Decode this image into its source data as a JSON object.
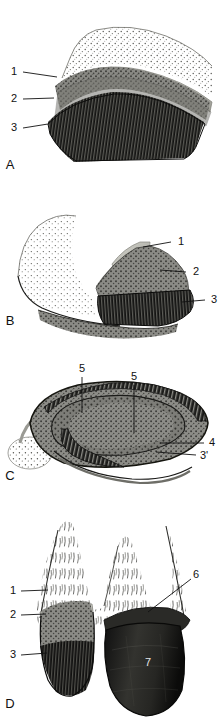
{
  "figure": {
    "type": "anatomical-illustration",
    "panel_count": 4,
    "background_color": "#ffffff",
    "ink_color": "#111111"
  },
  "palette": {
    "paper": "#ffffff",
    "ink": "#111111",
    "skin_stipple": "#ffffff",
    "band_light": "#b9b9b3",
    "band_light_edge": "#8e8e88",
    "layer_mid": "#7d7d78",
    "layer_mid_dark": "#5e5e59",
    "layer_dark": "#2a2a28",
    "layer_darkest": "#141413",
    "horn_black": "#1b1b1a",
    "label_white": "#e8e8e8"
  },
  "panels": [
    {
      "id": "a",
      "letter": "A",
      "view": "external-lateral-surface",
      "letter_pos": {
        "x": 10,
        "y": 166
      },
      "labels": [
        {
          "text": "1",
          "x": 14,
          "y": 72,
          "leader": [
            [
              23,
              72
            ],
            [
              57,
              77
            ]
          ],
          "target": "periople-band"
        },
        {
          "text": "2",
          "x": 14,
          "y": 99,
          "leader": [
            [
              23,
              99
            ],
            [
              54,
              98
            ]
          ],
          "target": "stratum-medium-upper"
        },
        {
          "text": "3",
          "x": 14,
          "y": 128,
          "leader": [
            [
              23,
              128
            ],
            [
              48,
              124
            ]
          ],
          "target": "stratum-medium-striated"
        }
      ]
    },
    {
      "id": "b",
      "letter": "B",
      "view": "sagittal-section",
      "letter_pos": {
        "x": 10,
        "y": 132
      },
      "labels": [
        {
          "text": "1",
          "x": 176,
          "y": 52,
          "leader": [
            [
              172,
              52
            ],
            [
              143,
              57
            ]
          ],
          "target": "periople-band"
        },
        {
          "text": "2",
          "x": 192,
          "y": 82,
          "leader": [
            [
              187,
              82
            ],
            [
              160,
              80
            ]
          ],
          "target": "stratum-medium"
        },
        {
          "text": "3",
          "x": 210,
          "y": 110,
          "leader": [
            [
              205,
              110
            ],
            [
              183,
              112
            ]
          ],
          "target": "stratum-medium-striated"
        }
      ]
    },
    {
      "id": "c",
      "letter": "C",
      "view": "transverse-section",
      "letter_pos": {
        "x": 10,
        "y": 122
      },
      "labels": [
        {
          "text": "5",
          "x": 82,
          "y": 14,
          "leader": [
            [
              82,
              22
            ],
            [
              82,
              58
            ]
          ],
          "target": "dermal-lamellae-inner"
        },
        {
          "text": "5",
          "x": 134,
          "y": 22,
          "leader": [
            [
              134,
              30
            ],
            [
              134,
              78
            ]
          ],
          "target": "dermal-lamellae-outer"
        },
        {
          "text": "4",
          "x": 210,
          "y": 88,
          "leader": [
            [
              204,
              88
            ],
            [
              160,
              88
            ]
          ],
          "target": "stratum-internum"
        },
        {
          "text": "3'",
          "x": 204,
          "y": 100,
          "leader": [
            [
              195,
              100
            ],
            [
              156,
              97
            ]
          ],
          "target": "stratum-medium-inner"
        }
      ]
    },
    {
      "id": "d",
      "letter": "D",
      "view": "dorsal-view-coronet",
      "letter_pos": {
        "x": 10,
        "y": 205
      },
      "labels": [
        {
          "text": "1",
          "x": 13,
          "y": 91,
          "leader": [
            [
              21,
              91
            ],
            [
              48,
              90
            ]
          ],
          "target": "periople"
        },
        {
          "text": "2",
          "x": 13,
          "y": 115,
          "leader": [
            [
              21,
              115
            ],
            [
              46,
              114
            ]
          ],
          "target": "stratum-medium"
        },
        {
          "text": "3",
          "x": 13,
          "y": 155,
          "leader": [
            [
              21,
              155
            ],
            [
              47,
              153
            ]
          ],
          "target": "stratum-medium-striated"
        },
        {
          "text": "6",
          "x": 196,
          "y": 76,
          "leader": [
            [
              191,
              79
            ],
            [
              148,
              112
            ]
          ],
          "target": "coronary-band"
        },
        {
          "text": "7",
          "x": 148,
          "y": 163,
          "leader": null,
          "target": "hoof-wall-horn",
          "style": "white"
        }
      ]
    }
  ],
  "legend_keys": [
    "1",
    "2",
    "3",
    "3'",
    "4",
    "5",
    "6",
    "7"
  ]
}
